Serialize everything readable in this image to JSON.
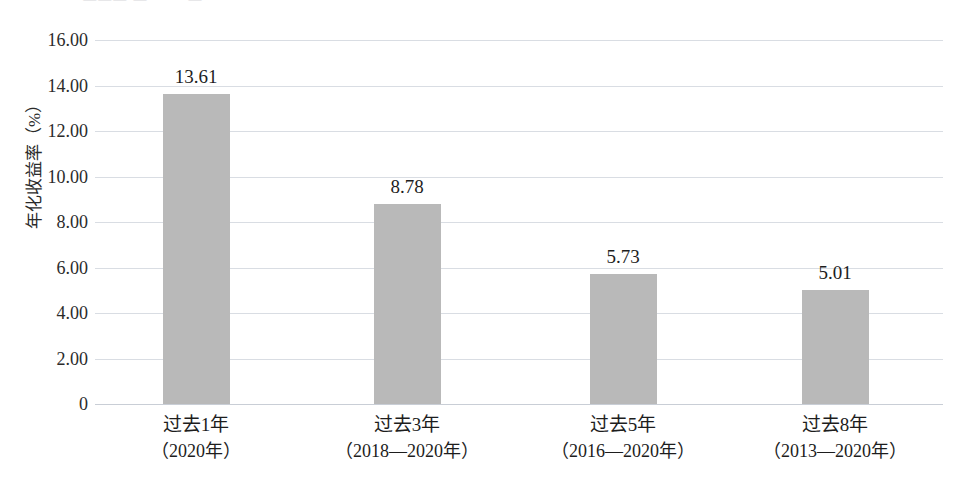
{
  "figure": {
    "cropped_header_sliver": "· ·   ——— — ·  ·  ·  —"
  },
  "chart_data": {
    "type": "bar",
    "title": "",
    "xlabel": "",
    "ylabel": "年化收益率（%）",
    "categories": [
      "过去1年",
      "过去3年",
      "过去5年",
      "过去8年"
    ],
    "category_sublabels": [
      "（2020年）",
      "（2018—2020年）",
      "（2016—2020年）",
      "（2013—2020年）"
    ],
    "values": [
      13.61,
      8.78,
      5.73,
      5.01
    ],
    "value_labels": [
      "13.61",
      "8.78",
      "5.73",
      "5.01"
    ],
    "ylim": [
      0,
      16
    ],
    "ytick_values": [
      0,
      2,
      4,
      6,
      8,
      10,
      12,
      14,
      16
    ],
    "ytick_labels": [
      "0",
      "2.00",
      "4.00",
      "6.00",
      "8.00",
      "10.00",
      "12.00",
      "14.00",
      "16.00"
    ],
    "grid": true,
    "legend": "none",
    "bar_color": "#b9b9b9",
    "grid_color": "#d9dde3",
    "text_color": "#1d1d1d"
  }
}
